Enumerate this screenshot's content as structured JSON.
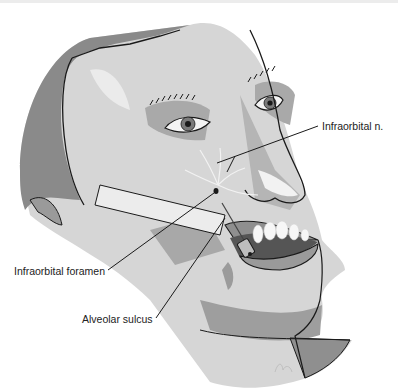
{
  "figure": {
    "labels": [
      {
        "id": "infraorbital-n",
        "text": "Infraorbital n."
      },
      {
        "id": "infraorbital-foramen",
        "text": "Infraorbital foramen"
      },
      {
        "id": "alveolar-sulcus",
        "text": "Alveolar sulcus"
      }
    ],
    "colors": {
      "background": "#ffffff",
      "skin_light": "#d9d9d9",
      "skin_mid": "#bdbdbd",
      "hair_dark": "#6f6f6f",
      "outline": "#1a1a1a",
      "teeth": "#f7f7f7",
      "nerve": "#f2f2f2"
    }
  }
}
